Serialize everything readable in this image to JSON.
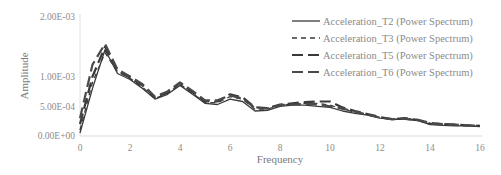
{
  "chart_data": {
    "type": "line",
    "title": "",
    "xlabel": "Frequency",
    "ylabel": "Amplitude",
    "xlim": [
      0,
      16
    ],
    "ylim": [
      0,
      0.002
    ],
    "x_ticks": [
      "0",
      "2",
      "4",
      "6",
      "8",
      "10",
      "12",
      "14",
      "16"
    ],
    "y_ticks": [
      "0.00E+00",
      "5.00E-04",
      "1.00E-03",
      "2.00E-03"
    ],
    "y_tick_values": [
      0,
      0.0005,
      0.001,
      0.002
    ],
    "grid": false,
    "legend_position": "top-right",
    "series": [
      {
        "name": "Acceleration_T2 (Power Spectrum)",
        "style": "solid",
        "x": [
          0,
          0.5,
          1,
          1.5,
          2,
          2.5,
          3,
          3.5,
          4,
          4.5,
          5,
          5.5,
          6,
          6.5,
          7,
          7.5,
          8,
          8.5,
          9,
          9.5,
          10,
          10.5,
          11,
          11.5,
          12,
          12.5,
          13,
          13.5,
          14,
          14.5,
          15,
          15.5,
          16
        ],
        "y": [
          5e-05,
          0.0008,
          0.00145,
          0.00105,
          0.00095,
          0.0008,
          0.00062,
          0.0007,
          0.00085,
          0.0007,
          0.00055,
          0.00053,
          0.00062,
          0.00058,
          0.00042,
          0.00043,
          0.0005,
          0.00052,
          0.00052,
          0.0005,
          0.00048,
          0.00042,
          0.00038,
          0.00035,
          0.0003,
          0.00028,
          0.00028,
          0.00026,
          0.00019,
          0.00018,
          0.00017,
          0.00017,
          0.00016
        ]
      },
      {
        "name": "Acceleration_T3 (Power Spectrum)",
        "style": "dashed-short",
        "x": [
          0,
          0.5,
          1,
          1.5,
          2,
          2.5,
          3,
          3.5,
          4,
          4.5,
          5,
          5.5,
          6,
          6.5,
          7,
          7.5,
          8,
          8.5,
          9,
          9.5,
          10,
          10.5,
          11,
          11.5,
          12,
          12.5,
          13,
          13.5,
          14,
          14.5,
          15,
          15.5,
          16
        ],
        "y": [
          0.0001,
          0.0009,
          0.0014,
          0.00108,
          0.00097,
          0.00082,
          0.00063,
          0.00072,
          0.00087,
          0.00072,
          0.00056,
          0.00056,
          0.00066,
          0.00062,
          0.00045,
          0.00045,
          0.00052,
          0.00054,
          0.00055,
          0.00055,
          0.00052,
          0.00045,
          0.0004,
          0.00036,
          0.00031,
          0.00028,
          0.00029,
          0.00027,
          0.0002,
          0.00019,
          0.00018,
          0.00017,
          0.00016
        ]
      },
      {
        "name": "Acceleration_T5 (Power Spectrum)",
        "style": "dashed-long",
        "x": [
          0,
          0.5,
          1,
          1.5,
          2,
          2.5,
          3,
          3.5,
          4,
          4.5,
          5,
          5.5,
          6,
          6.5,
          7,
          7.5,
          8,
          8.5,
          9,
          9.5,
          10,
          10.5,
          11,
          11.5,
          12,
          12.5,
          13,
          13.5,
          14,
          14.5,
          15,
          15.5,
          16
        ],
        "y": [
          0.0002,
          0.001,
          0.0015,
          0.0011,
          0.00098,
          0.00085,
          0.00065,
          0.00073,
          0.00089,
          0.00074,
          0.00058,
          0.00058,
          0.0007,
          0.00065,
          0.00048,
          0.00047,
          0.00053,
          0.00055,
          0.00057,
          0.00058,
          0.00058,
          0.00048,
          0.00042,
          0.00037,
          0.00032,
          0.00028,
          0.0003,
          0.00027,
          0.00021,
          0.0002,
          0.00019,
          0.00018,
          0.00017
        ]
      },
      {
        "name": "Acceleration_T6 (Power Spectrum)",
        "style": "dashed-long",
        "x": [
          0,
          0.5,
          1,
          1.5,
          2,
          2.5,
          3,
          3.5,
          4,
          4.5,
          5,
          5.5,
          6,
          6.5,
          7,
          7.5,
          8,
          8.5,
          9,
          9.5,
          10,
          10.5,
          11,
          11.5,
          12,
          12.5,
          13,
          13.5,
          14,
          14.5,
          15,
          15.5,
          16
        ],
        "y": [
          0.0003,
          0.0012,
          0.00155,
          0.00112,
          0.001,
          0.00087,
          0.00066,
          0.00075,
          0.0009,
          0.00076,
          0.0006,
          0.0006,
          0.00068,
          0.00063,
          0.00047,
          0.00046,
          0.00052,
          0.00053,
          0.00054,
          0.00053,
          0.0005,
          0.00046,
          0.00041,
          0.00036,
          0.00031,
          0.00028,
          0.00029,
          0.00027,
          0.00022,
          0.0002,
          0.00019,
          0.00018,
          0.00017
        ]
      }
    ]
  },
  "legend": {
    "items": [
      {
        "label": "Acceleration_T2 (Power Spectrum)",
        "style": "solid"
      },
      {
        "label": "Acceleration_T3 (Power Spectrum)",
        "style": "dashed-short"
      },
      {
        "label": "Acceleration_T5 (Power Spectrum)",
        "style": "dashed-long"
      },
      {
        "label": "Acceleration_T6 (Power Spectrum)",
        "style": "dashed-long"
      }
    ]
  },
  "colors": {
    "line": "#3a3a3a",
    "axis": "#d9d9d9",
    "text": "#8c8c8c"
  }
}
